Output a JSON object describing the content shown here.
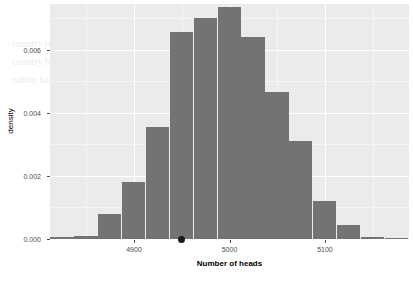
{
  "chart_data": {
    "type": "bar",
    "subtype": "histogram",
    "title": "",
    "xlabel": "Number of heads",
    "ylabel": "density",
    "xlim": [
      4812,
      5188
    ],
    "ylim": [
      0.0,
      0.00745
    ],
    "xticks": [
      4900,
      5000,
      5100
    ],
    "xtick_labels": [
      "4900",
      "5000",
      "5100"
    ],
    "yticks": [
      0.0,
      0.002,
      0.004,
      0.006
    ],
    "ytick_labels": [
      "0.000",
      "0.002",
      "0.004",
      "0.006"
    ],
    "grid": true,
    "legend": null,
    "bin_width": 25,
    "bin_centers": [
      4825,
      4850,
      4875,
      4900,
      4925,
      4950,
      4975,
      5000,
      5025,
      5050,
      5075,
      5100,
      5125,
      5150,
      5175
    ],
    "bin_starts": [
      4812.5,
      4837.5,
      4862.5,
      4887.5,
      4912.5,
      4937.5,
      4962.5,
      4987.5,
      5012.5,
      5037.5,
      5062.5,
      5087.5,
      5112.5,
      5137.5,
      5162.5
    ],
    "values": [
      5e-05,
      8e-05,
      0.0008,
      0.0018,
      0.00355,
      0.00655,
      0.007,
      0.00735,
      0.0064,
      0.00465,
      0.0031,
      0.0012,
      0.00045,
      6e-05,
      4e-05
    ],
    "bar_color": "#737373",
    "panel_background": "#ebebeb",
    "gridline_color": "#ffffff",
    "annotations": [
      {
        "name": "observed-value-point",
        "type": "point",
        "x": 4950,
        "y": 0.0,
        "color": "#1a1a1a"
      }
    ]
  },
  "background_text": [
    "he Story Behind the Data",
    "country is thought of as a nation of children. In the Dutch world",
    "country has one of the highest birth rates; however, fertility",
    "nation has a fertility rate in regard to less than the numbers"
  ]
}
